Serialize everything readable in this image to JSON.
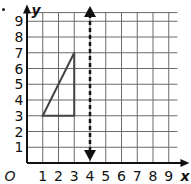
{
  "diagram": {
    "type": "coordinate-grid",
    "axes": {
      "x_label": "x",
      "y_label": "y",
      "origin_label": "O",
      "x_ticks": [
        "1",
        "2",
        "3",
        "4",
        "5",
        "6",
        "7",
        "8",
        "9"
      ],
      "y_ticks": [
        "1",
        "2",
        "3",
        "4",
        "5",
        "6",
        "7",
        "8",
        "9"
      ],
      "x_range": [
        0,
        9.6
      ],
      "y_range": [
        0,
        9.6
      ]
    },
    "shapes": [
      {
        "type": "triangle",
        "vertices": [
          [
            1,
            3
          ],
          [
            3,
            3
          ],
          [
            3,
            7
          ]
        ],
        "stroke": "#444444"
      },
      {
        "type": "dashed-line",
        "label": "line x = 4",
        "x": 4,
        "arrows": "both",
        "stroke": "#111111"
      }
    ],
    "colors": {
      "grid": "#555555",
      "axis": "#111111",
      "background": "#ffffff"
    }
  }
}
